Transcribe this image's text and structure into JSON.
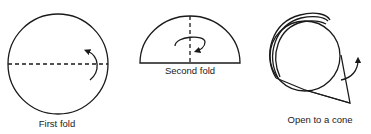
{
  "figure": {
    "steps": [
      {
        "label": "First fold",
        "shape": "circle",
        "fold_line": "horizontal-dashed",
        "arrow": "curved-up"
      },
      {
        "label": "Second fold",
        "shape": "semicircle",
        "fold_line": "vertical-dashed",
        "arrow": "curved-clockwise"
      },
      {
        "label": "Open to a cone",
        "shape": "cone",
        "arrow": "curved-up"
      }
    ],
    "stroke_color": "#1a1a1a",
    "background": "#ffffff"
  }
}
